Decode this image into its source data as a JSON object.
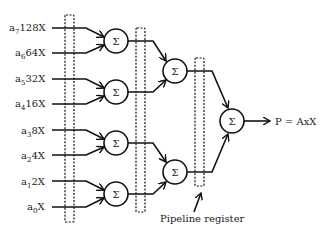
{
  "diagram": {
    "inputs": [
      {
        "coef": "a",
        "sub": "7",
        "mult": "128X"
      },
      {
        "coef": "a",
        "sub": "6",
        "mult": "64X"
      },
      {
        "coef": "a",
        "sub": "5",
        "mult": "32X"
      },
      {
        "coef": "a",
        "sub": "4",
        "mult": "16X"
      },
      {
        "coef": "a",
        "sub": "3",
        "mult": "8X"
      },
      {
        "coef": "a",
        "sub": "2",
        "mult": "4X"
      },
      {
        "coef": "a",
        "sub": "1",
        "mult": "2X"
      },
      {
        "coef": "a",
        "sub": "0",
        "mult": "X"
      }
    ],
    "adder_symbol": "Σ",
    "output_label": "P = AxX",
    "register_label": "Pipeline register"
  }
}
